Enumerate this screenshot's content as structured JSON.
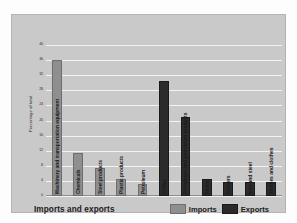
{
  "chart_data": {
    "type": "bar",
    "title": "Imports and exports",
    "xlabel": "",
    "ylabel": "Percentage of total",
    "ylim": [
      0,
      40
    ],
    "grid": true,
    "legend_position": "bottom-right",
    "yticks": [
      40,
      36,
      32,
      28,
      24,
      20,
      16,
      12,
      8,
      4,
      0
    ],
    "categories": [
      "Machinery and transportation equipment",
      "Chemicals",
      "Steel products",
      "Plastic products",
      "Petroleum",
      "Coffee",
      "Petroleum and petroleum products",
      "Fruits",
      "Flowers",
      "Iron and steel",
      "Textiles and clothes"
    ],
    "series": [
      {
        "name": "Imports",
        "color": "#8f8f8f",
        "values": [
          36,
          11.5,
          7.5,
          4.5,
          3.2,
          null,
          null,
          null,
          null,
          null,
          null
        ]
      },
      {
        "name": "Exports",
        "color": "#2b2b2b",
        "values": [
          null,
          null,
          null,
          null,
          null,
          30.5,
          21,
          4.5,
          3.8,
          3.6,
          3.6
        ]
      }
    ],
    "bars": [
      {
        "category": "Machinery and transportation equipment",
        "series": "Imports",
        "value": 36
      },
      {
        "category": "Chemicals",
        "series": "Imports",
        "value": 11.5
      },
      {
        "category": "Steel products",
        "series": "Imports",
        "value": 7.5
      },
      {
        "category": "Plastic products",
        "series": "Imports",
        "value": 4.5
      },
      {
        "category": "Petroleum",
        "series": "Imports",
        "value": 3.2
      },
      {
        "category": "Coffee",
        "series": "Exports",
        "value": 30.5
      },
      {
        "category": "Petroleum and petroleum products",
        "series": "Exports",
        "value": 21
      },
      {
        "category": "Fruits",
        "series": "Exports",
        "value": 4.5
      },
      {
        "category": "Flowers",
        "series": "Exports",
        "value": 3.8
      },
      {
        "category": "Iron and steel",
        "series": "Exports",
        "value": 3.6
      },
      {
        "category": "Textiles and clothes",
        "series": "Exports",
        "value": 3.6
      }
    ]
  },
  "legend": {
    "imports_label": "Imports",
    "exports_label": "Exports"
  }
}
